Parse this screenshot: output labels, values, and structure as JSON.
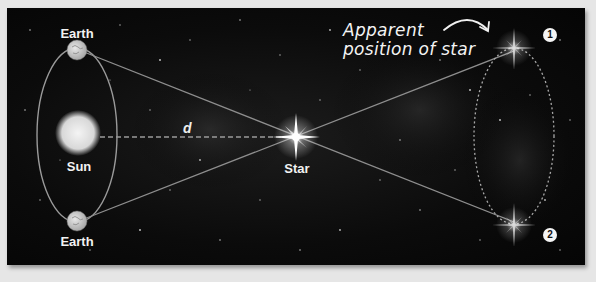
{
  "diagram": {
    "labels": {
      "earth_top": "Earth",
      "earth_bottom": "Earth",
      "sun": "Sun",
      "star": "Star",
      "distance": "d",
      "apparent_position": "Apparent position of star",
      "apparent_line1": "Apparent",
      "apparent_line2": "position of star",
      "position_1": "1",
      "position_2": "2"
    },
    "colors": {
      "background": "#e6e6e6",
      "panel": "#0b0b0b",
      "line": "#9a9a9a",
      "text": "#f2f2f2"
    },
    "elements": [
      {
        "name": "Earth (top)",
        "x": 77,
        "y": 50
      },
      {
        "name": "Earth (bottom)",
        "x": 77,
        "y": 221
      },
      {
        "name": "Sun",
        "x": 77,
        "y": 133
      },
      {
        "name": "Star",
        "x": 296,
        "y": 137
      },
      {
        "name": "Apparent position 1",
        "x": 514,
        "y": 48
      },
      {
        "name": "Apparent position 2",
        "x": 514,
        "y": 225
      }
    ]
  }
}
